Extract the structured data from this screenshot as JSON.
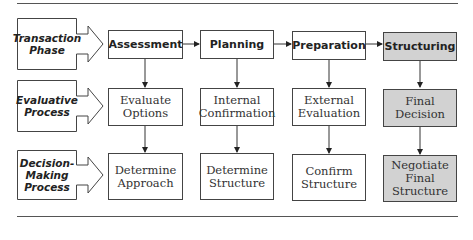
{
  "row_labels": [
    {
      "lines": [
        "Transaction",
        "Phase"
      ]
    },
    {
      "lines": [
        "Evaluative",
        "Process"
      ]
    },
    {
      "lines": [
        "Decision-",
        "Making",
        "Process"
      ]
    }
  ],
  "phases": [
    {
      "label": "Assessment",
      "shaded": false
    },
    {
      "label": "Planning",
      "shaded": false
    },
    {
      "label": "Preparation",
      "shaded": false
    },
    {
      "label": "Structuring",
      "shaded": true
    }
  ],
  "evaluative": [
    {
      "lines": [
        "Evaluate",
        "Options"
      ],
      "shaded": false
    },
    {
      "lines": [
        "Internal",
        "Confirmation"
      ],
      "shaded": false
    },
    {
      "lines": [
        "External",
        "Evaluation"
      ],
      "shaded": false
    },
    {
      "lines": [
        "Final",
        "Decision"
      ],
      "shaded": true
    }
  ],
  "decision": [
    {
      "lines": [
        "Determine",
        "Approach"
      ],
      "shaded": false
    },
    {
      "lines": [
        "Determine",
        "Structure"
      ],
      "shaded": false
    },
    {
      "lines": [
        "Confirm",
        "Structure"
      ],
      "shaded": false
    },
    {
      "lines": [
        "Negotiate",
        "Final",
        "Structure"
      ],
      "shaded": true
    }
  ],
  "colors": {
    "shade": "#d2d2d2",
    "border": "#444444"
  }
}
